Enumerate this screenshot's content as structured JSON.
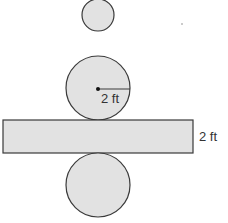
{
  "diagram": {
    "colors": {
      "fill": "#e2e2e2",
      "stroke": "#3a3a3a",
      "text": "#333333"
    },
    "small_circle": {
      "cx": 98,
      "cy": 15,
      "r": 16
    },
    "top_circle": {
      "cx": 98,
      "cy": 88,
      "r": 32
    },
    "rectangle": {
      "x": 3,
      "y": 120,
      "width": 190,
      "height": 33
    },
    "bottom_circle": {
      "cx": 98,
      "cy": 185,
      "r": 32
    },
    "labels": {
      "radius": "2 ft",
      "height": "2 ft"
    },
    "stray_mark": {
      "x": 182,
      "y": 24
    }
  }
}
